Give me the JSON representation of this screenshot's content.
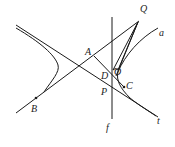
{
  "diagram": {
    "type": "geometry-figure",
    "labels": {
      "Q": "Q",
      "a": "a",
      "A": "A",
      "D": "D",
      "O": "O",
      "P": "P",
      "C": "C",
      "B": "B",
      "f": "f",
      "t": "t"
    },
    "colors": {
      "stroke": "#1a1a1a",
      "background": "#ffffff"
    }
  }
}
